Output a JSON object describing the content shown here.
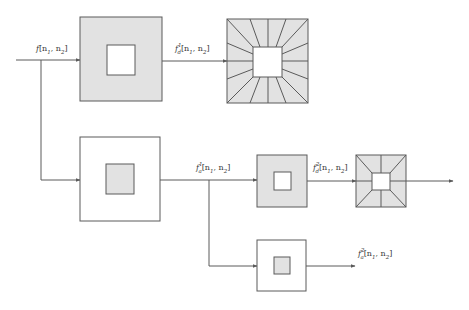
{
  "colors": {
    "stroke": "#5a5a5a",
    "fill_gray": "#e2e2e2",
    "fill_white": "#ffffff",
    "background": "#ffffff"
  },
  "labels": {
    "input": {
      "base": "f",
      "sup": "",
      "sub": "",
      "args": "[n",
      "a1": "1",
      "mid": ", n",
      "a2": "2",
      "end": "]"
    },
    "top_out": {
      "base": "f",
      "sup": "1",
      "sub": "d",
      "args": "[n",
      "a1": "1",
      "mid": ", n",
      "a2": "2",
      "end": "]"
    },
    "mid_out": {
      "base": "f",
      "sup": "1",
      "sub": "a",
      "args": "[n",
      "a1": "1",
      "mid": ", n",
      "a2": "2",
      "end": "]"
    },
    "right_out": {
      "base": "f",
      "sup": "2",
      "sub": "d",
      "args": "[n",
      "a1": "1",
      "mid": ", n",
      "a2": "2",
      "end": "]"
    },
    "bottom_out": {
      "base": "f",
      "sup": "2",
      "sub": "a",
      "args": "[n",
      "a1": "1",
      "mid": ", n",
      "a2": "2",
      "end": "]"
    }
  },
  "blocks": [
    {
      "id": "highpass-1",
      "outer_fill": "gray",
      "inner_fill": "white",
      "pattern": "none"
    },
    {
      "id": "directional-filterbank-1",
      "outer_fill": "gray",
      "inner_fill": "white",
      "pattern": "radial-16"
    },
    {
      "id": "lowpass-1",
      "outer_fill": "white",
      "inner_fill": "gray",
      "pattern": "none"
    },
    {
      "id": "highpass-2",
      "outer_fill": "gray",
      "inner_fill": "white",
      "pattern": "none"
    },
    {
      "id": "directional-filterbank-2",
      "outer_fill": "gray",
      "inner_fill": "white",
      "pattern": "radial-8"
    },
    {
      "id": "lowpass-2",
      "outer_fill": "white",
      "inner_fill": "gray",
      "pattern": "none"
    }
  ]
}
